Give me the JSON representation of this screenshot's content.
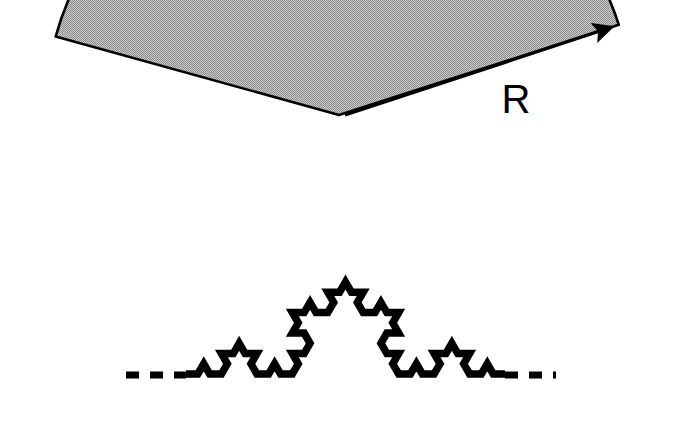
{
  "figure": {
    "type": "geometric-diagram",
    "background_color": "#ffffff",
    "fill_color": "#aaaaaa",
    "stroke_color": "#000000",
    "labels": {
      "radius_label": "R"
    },
    "geometry": {
      "circle_center": [
        339,
        115
      ],
      "circle_radius": 294,
      "koch_left_endpoint": [
        186,
        374
      ],
      "koch_right_endpoint": [
        505,
        374
      ],
      "koch_apex": [
        345,
        115
      ],
      "koch_iterations": 3,
      "radius_arrow_from": [
        345,
        115
      ],
      "radius_arrow_to": [
        612,
        27
      ],
      "sector_left_corner": [
        43,
        33
      ],
      "dash_left_from": [
        126,
        375
      ],
      "dash_left_to": [
        186,
        375
      ],
      "dash_right_from": [
        505,
        375
      ],
      "dash_right_to": [
        556,
        375
      ]
    },
    "elements": {
      "disk_name": "shaded-disk-region",
      "koch_name": "koch-curve",
      "arrow_name": "radius-arrow",
      "dash_left_name": "baseline-dash-left",
      "dash_right_name": "baseline-dash-right"
    }
  }
}
